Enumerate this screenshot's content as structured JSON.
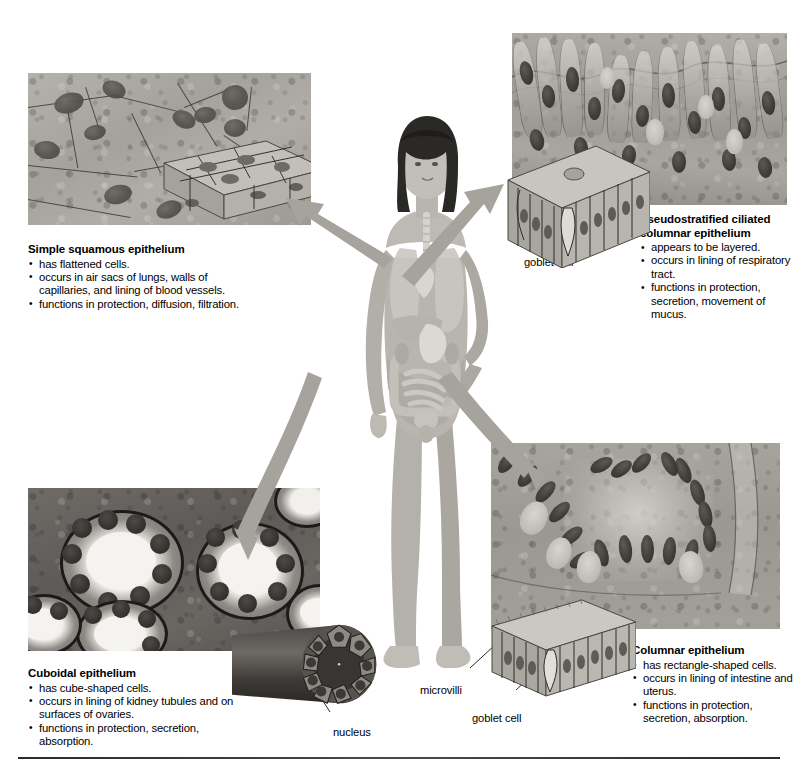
{
  "figure": {
    "background_color": "#ffffff",
    "rule_color": "#2b2b2b"
  },
  "panels": [
    {
      "id": "simple-squamous",
      "caption_title": "Simple squamous epithelium",
      "bullets": [
        "has flattened cells.",
        "occurs in air sacs of lungs, walls of capillaries, and lining of blood vessels.",
        "functions in protection, diffusion, filtration."
      ]
    },
    {
      "id": "pseudostratified",
      "caption_title": "Pseudostratified ciliated columnar epithelium",
      "bullets": [
        "appears to be layered.",
        "occurs in lining of respiratory tract.",
        "functions in protection, secretion, movement of mucus."
      ]
    },
    {
      "id": "cuboidal",
      "caption_title": "Cuboidal epithelium",
      "bullets": [
        "has cube-shaped cells.",
        "occurs in lining of kidney tubules and on surfaces of ovaries.",
        "functions in protection, secretion, absorption."
      ]
    },
    {
      "id": "columnar",
      "caption_title": "Columnar epithelium",
      "bullets": [
        "has rectangle-shaped cells.",
        "occurs in lining of intestine and uterus.",
        "functions in protection, secretion, absorption."
      ]
    }
  ],
  "labels": {
    "goblet_cell_top": "goblet cell",
    "goblet_cell_bottom": "goblet cell",
    "microvilli": "microvilli",
    "nucleus": "nucleus"
  },
  "colors": {
    "arrow": "#a6a39d",
    "micrograph_gray": "#9a9a9a",
    "text": "#000000"
  }
}
